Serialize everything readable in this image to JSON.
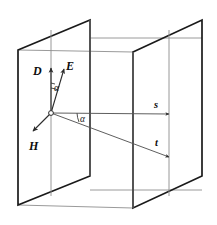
{
  "figure": {
    "background_color": "#ffffff",
    "colors": {
      "plane_edge_dark": "#1a1a1a",
      "plane_edge_mid": "#4d4d4d",
      "connector_gray": "#9a9a9a",
      "vector_stroke": "#2b2b2b",
      "label_color": "#0d0d0d"
    },
    "planes": [
      {
        "name": "left-plane",
        "label": "left vertical plane",
        "points": "18,50 90,20 90,176 18,205"
      },
      {
        "name": "right-plane",
        "label": "right vertical plane",
        "points": "133,52 202,20 202,176 133,208"
      }
    ],
    "connectors": [
      {
        "name": "top-connector",
        "x1": 90,
        "y1": 38,
        "x2": 202,
        "y2": 38
      },
      {
        "name": "upper-left-connector",
        "x1": 18,
        "y1": 50,
        "x2": 133,
        "y2": 52
      },
      {
        "name": "bottom-connector",
        "x1": 90,
        "y1": 190,
        "x2": 202,
        "y2": 190
      },
      {
        "name": "lower-left-connector",
        "x1": 18,
        "y1": 205,
        "x2": 133,
        "y2": 208
      }
    ],
    "origin": {
      "name": "vector-origin",
      "x": 51,
      "y": 113,
      "radius": 2.4
    },
    "vectors": [
      {
        "name": "vector-D",
        "label": "D",
        "label_x": 33,
        "label_y": 75,
        "x1": 51,
        "y1": 113,
        "x2": 51,
        "y2": 68,
        "description": "electric displacement vector, vertical up"
      },
      {
        "name": "vector-E",
        "label": "E",
        "label_x": 66,
        "label_y": 70,
        "x1": 51,
        "y1": 113,
        "x2": 64,
        "y2": 69,
        "description": "electric field vector, tilted up-right"
      },
      {
        "name": "vector-H",
        "label": "H",
        "label_x": 29,
        "label_y": 150,
        "x1": 51,
        "y1": 113,
        "x2": 33,
        "y2": 131,
        "description": "magnetic field vector, down-left"
      },
      {
        "name": "vector-s",
        "label": "s",
        "label_x": 154,
        "label_y": 108,
        "x1": 51,
        "y1": 113,
        "x2": 169,
        "y2": 114,
        "description": "ray direction s, horizontal to right plane"
      },
      {
        "name": "vector-t",
        "label": "t",
        "label_x": 155,
        "label_y": 146,
        "x1": 51,
        "y1": 113,
        "x2": 169,
        "y2": 157,
        "description": "energy flow direction t, sloping down-right"
      }
    ],
    "angles": [
      {
        "name": "angle-alpha-upper",
        "label": "α",
        "label_x": 54,
        "label_y": 91,
        "description": "angle between D and E"
      },
      {
        "name": "angle-alpha-lower",
        "label": "α",
        "label_x": 80,
        "label_y": 122,
        "description": "angle between s and t"
      }
    ]
  }
}
